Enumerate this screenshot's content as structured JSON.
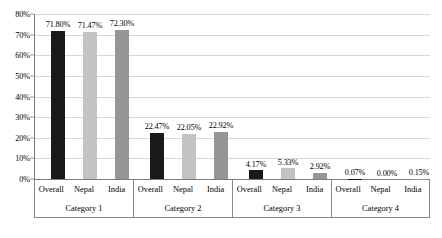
{
  "chart_data": {
    "type": "bar",
    "title": "",
    "subtitle": "",
    "xlabel": "",
    "ylabel": "",
    "ylim": [
      0,
      80
    ],
    "ytick_labels": [
      "0%",
      "10%",
      "20%",
      "30%",
      "40%",
      "50%",
      "60%",
      "70%",
      "80%"
    ],
    "ytick_values": [
      0,
      10,
      20,
      30,
      40,
      50,
      60,
      70,
      80
    ],
    "grid": true,
    "legend_position": "none",
    "categories": [
      "Category 1",
      "Category 2",
      "Category 3",
      "Category 4"
    ],
    "series": [
      {
        "name": "Overall",
        "color": "#191919",
        "values": [
          71.8,
          22.47,
          4.17,
          0.07
        ],
        "labels": [
          "71.80%",
          "22.47%",
          "4.17%",
          "0.07%"
        ]
      },
      {
        "name": "Nepal",
        "color": "#c3c3c3",
        "values": [
          71.47,
          22.05,
          5.33,
          0.0
        ],
        "labels": [
          "71.47%",
          "22.05%",
          "5.33%",
          "0.00%"
        ]
      },
      {
        "name": "India",
        "color": "#969696",
        "values": [
          72.3,
          22.92,
          2.92,
          0.15
        ],
        "labels": [
          "72.30%",
          "22.92%",
          "2.92%",
          "0.15%"
        ]
      }
    ]
  },
  "axis": {
    "y_labels": [
      "80%",
      "70%",
      "60%",
      "50%",
      "40%",
      "30%",
      "20%",
      "10%",
      "0%"
    ]
  },
  "groups": [
    {
      "category": "Category 1",
      "series_names": [
        "Overall",
        "Nepal",
        "India"
      ],
      "bar_labels": [
        "71.80%",
        "71.47%",
        "72.30%"
      ]
    },
    {
      "category": "Category 2",
      "series_names": [
        "Overall",
        "Nepal",
        "India"
      ],
      "bar_labels": [
        "22.47%",
        "22.05%",
        "22.92%"
      ]
    },
    {
      "category": "Category 3",
      "series_names": [
        "Overall",
        "Nepal",
        "India"
      ],
      "bar_labels": [
        "4.17%",
        "5.33%",
        "2.92%"
      ]
    },
    {
      "category": "Category 4",
      "series_names": [
        "Overall",
        "Nepal",
        "India"
      ],
      "bar_labels": [
        "0.07%",
        "0.00%",
        "0.15%"
      ]
    }
  ]
}
